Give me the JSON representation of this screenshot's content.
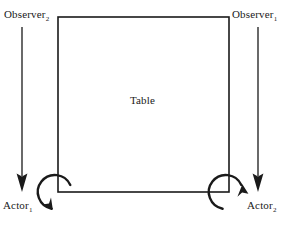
{
  "figure": {
    "type": "schematic-diagram",
    "width": 285,
    "height": 231,
    "background_color": "#ffffff",
    "stroke_color": "#1a1a1a",
    "text_color": "#1a1a1a"
  },
  "labels": {
    "table": "Table",
    "observer_left": {
      "base": "Observer",
      "subscript": "2"
    },
    "observer_right": {
      "base": "Observer",
      "subscript": "1"
    },
    "actor_left": {
      "base": "Actor",
      "subscript": "1"
    },
    "actor_right": {
      "base": "Actor",
      "subscript": "2"
    }
  },
  "shapes": {
    "table_rectangle": {
      "name": "table",
      "x": 58,
      "y": 17,
      "width": 171,
      "height": 175,
      "stroke_width": 1.6,
      "fill": "none"
    },
    "gaze_arrows": [
      {
        "name": "observer-left-gaze-arrow",
        "x": 22,
        "y_start": 27,
        "y_end": 191,
        "direction": "down",
        "stroke_width": 1.3
      },
      {
        "name": "observer-right-gaze-arrow",
        "x": 258,
        "y_start": 27,
        "y_end": 191,
        "direction": "down",
        "stroke_width": 1.3
      }
    ],
    "rotation_arcs": [
      {
        "name": "actor-left-rotation-arc",
        "cx": 58,
        "cy": 192,
        "r": 17,
        "stroke_width": 2.4,
        "sweep": "clockwise"
      },
      {
        "name": "actor-right-rotation-arc",
        "cx": 229,
        "cy": 192,
        "r": 17,
        "stroke_width": 2.4,
        "sweep": "clockwise"
      }
    ]
  }
}
